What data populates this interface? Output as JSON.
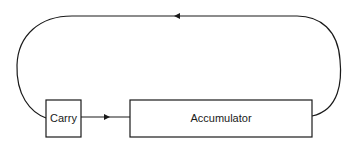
{
  "diagram": {
    "type": "block-diagram",
    "blocks": [
      {
        "id": "carry",
        "label": "Carry"
      },
      {
        "id": "accumulator",
        "label": "Accumulator"
      }
    ],
    "connections": [
      {
        "from": "carry",
        "to": "accumulator",
        "direction": "right"
      },
      {
        "from": "accumulator",
        "to": "carry",
        "direction": "left",
        "path": "feedback-loop-over-top"
      }
    ],
    "colors": {
      "stroke": "#1a1a1a",
      "background": "#ffffff"
    }
  }
}
